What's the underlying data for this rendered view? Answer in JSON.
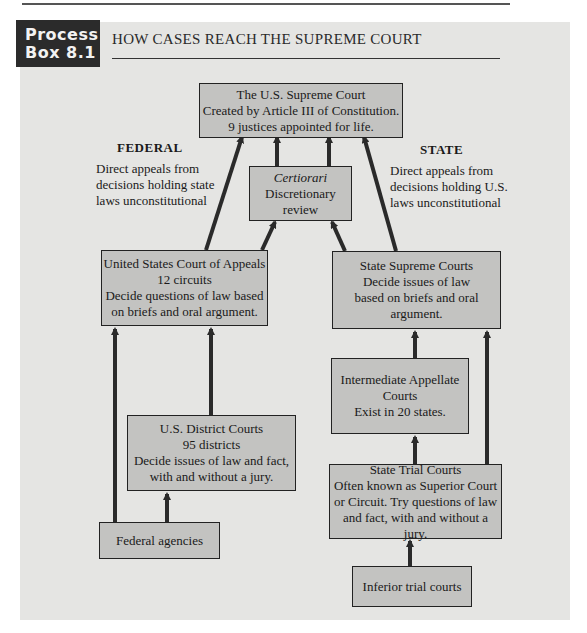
{
  "header": {
    "label_line1": "Process",
    "label_line2": "Box 8.1",
    "title": "HOW CASES REACH THE SUPREME COURT"
  },
  "columns": {
    "federal": {
      "heading": "FEDERAL",
      "note": [
        "Direct appeals from",
        "decisions holding state",
        "laws unconstitutional"
      ]
    },
    "state": {
      "heading": "STATE",
      "note": [
        "Direct appeals from",
        "decisions holding U.S.",
        "laws unconstitutional"
      ]
    }
  },
  "boxes": {
    "supreme": [
      "The U.S. Supreme Court",
      "Created by Article III of Constitution.",
      "9 justices appointed for life."
    ],
    "certiorari": [
      "Certiorari",
      "Discretionary",
      "review"
    ],
    "appeals": [
      "United States Court of Appeals",
      "12 circuits",
      "Decide questions of law based",
      "on briefs and oral argument."
    ],
    "state_supreme": [
      "State Supreme Courts",
      "Decide issues of law",
      "based on briefs and oral",
      "argument."
    ],
    "intermediate": [
      "Intermediate Appellate",
      "Courts",
      "Exist in 20 states."
    ],
    "district": [
      "U.S. District Courts",
      "95 districts",
      "Decide issues of law and fact,",
      "with and without a jury."
    ],
    "state_trial": [
      "State Trial Courts",
      "Often known as Superior Court",
      "or Circuit. Try questions of law",
      "and fact, with and without a jury."
    ],
    "federal_agencies": [
      "Federal agencies"
    ],
    "inferior": [
      "Inferior trial courts"
    ]
  },
  "colors": {
    "box_fill": "#c3c3c1",
    "panel": "#e5e5e3",
    "label_bg": "#2b2b2b",
    "line": "#2a2a2a"
  }
}
